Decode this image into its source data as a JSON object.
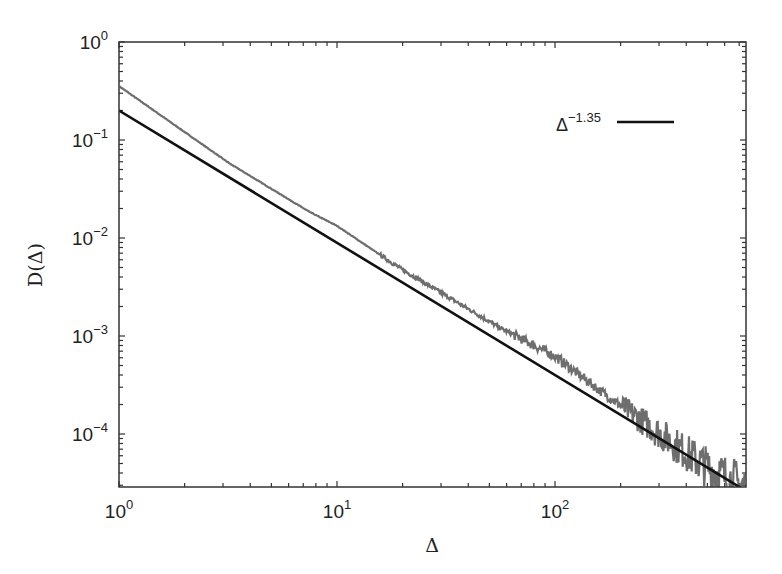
{
  "chart_data": {
    "type": "line",
    "title": "",
    "xlabel": "Δ",
    "ylabel": "D(Δ)",
    "xscale": "log",
    "yscale": "log",
    "xlim": [
      1,
      750
    ],
    "ylim": [
      2.9e-05,
      1
    ],
    "grid": false,
    "legend_position": "upper right",
    "x_ticks": [
      {
        "value": 1,
        "base": "10",
        "exp": "0"
      },
      {
        "value": 10,
        "base": "10",
        "exp": "1"
      },
      {
        "value": 100,
        "base": "10",
        "exp": "2"
      }
    ],
    "y_ticks": [
      {
        "value": 1,
        "base": "10",
        "exp": "0"
      },
      {
        "value": 0.1,
        "base": "10",
        "exp": "−1"
      },
      {
        "value": 0.01,
        "base": "10",
        "exp": "−2"
      },
      {
        "value": 0.001,
        "base": "10",
        "exp": "−3"
      },
      {
        "value": 0.0001,
        "base": "10",
        "exp": "−4"
      }
    ],
    "series": [
      {
        "name": "D(Δ) data",
        "color": "#6e6e6e",
        "style": "noisy",
        "x": [
          1,
          3.2,
          7.5,
          10,
          19.5,
          56,
          100,
          160,
          463,
          704
        ],
        "y": [
          0.355,
          0.058,
          0.0184,
          0.0133,
          0.0049,
          0.00121,
          0.00062,
          0.00028,
          5.1e-05,
          3e-05
        ]
      },
      {
        "name": "Δ^-1.35",
        "color": "#111111",
        "style": "solid",
        "formula": "0.2 * Δ^-1.35",
        "prefactor": 0.2,
        "exponent": -1.35,
        "x": [
          1,
          10,
          100,
          700
        ],
        "y": [
          0.2,
          0.00893,
          0.000399,
          2.91e-05
        ]
      }
    ],
    "legend": [
      {
        "label_base": "Δ",
        "label_exp": "−1.35",
        "color": "#111111"
      }
    ]
  }
}
